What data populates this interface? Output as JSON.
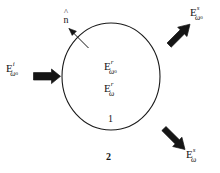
{
  "figure": {
    "kind": "scattering-sphere-diagram",
    "background_color": "#ffffff",
    "stroke_color": "#1a1a1a",
    "sphere": {
      "center_x": 111,
      "center_y": 76,
      "radius_x": 49,
      "radius_y": 53
    }
  },
  "labels": {
    "incident": {
      "base": "E",
      "superscript": "i",
      "subscript": "ω",
      "sub_subscript": "0",
      "full": "E i ω0"
    },
    "internal_elastic": {
      "base": "E",
      "superscript": "r",
      "subscript": "ω",
      "sub_subscript": "0",
      "full": "E r ω0"
    },
    "internal_shifted": {
      "base": "E",
      "superscript": "r",
      "subscript": "ω",
      "sub_subscript": "",
      "full": "E r ω"
    },
    "scattered_elastic": {
      "base": "E",
      "superscript": "s",
      "subscript": "ω",
      "sub_subscript": "0",
      "full": "E s ω0"
    },
    "scattered_shifted": {
      "base": "E",
      "superscript": "s",
      "subscript": "ω",
      "sub_subscript": "",
      "full": "E s ω"
    },
    "normal_vector": {
      "hat": "˄",
      "symbol": "n",
      "full": "n̂"
    },
    "region_inside": "1",
    "region_outside": "2"
  },
  "arrows": {
    "incident_arrow": "double-stroke-arrow-right",
    "scattered_elastic_arrow": "double-stroke-arrow-up-right",
    "scattered_shifted_arrow": "double-stroke-arrow-down-right",
    "normal_arrow": "thin-arrow-up-left"
  }
}
